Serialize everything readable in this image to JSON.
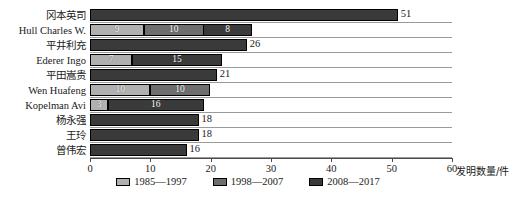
{
  "chart_data": {
    "type": "bar",
    "orientation": "horizontal",
    "stacked": true,
    "title": "",
    "xlabel": "发明数量/件",
    "ylabel": "",
    "xlim": [
      0,
      60
    ],
    "xticks": [
      0,
      10,
      20,
      30,
      40,
      50,
      60
    ],
    "grid": true,
    "legend_position": "bottom",
    "categories": [
      "冈本英司",
      "Hull Charles W.",
      "平井利充",
      "Ederer Ingo",
      "平田嵩贵",
      "Wen Huafeng",
      "Kopelman Avi",
      "杨永强",
      "王玲",
      "曾伟宏"
    ],
    "series": [
      {
        "name": "1985—1997",
        "color": "#b0b0b0",
        "values": [
          0,
          9,
          0,
          7,
          0,
          10,
          3,
          0,
          0,
          0
        ]
      },
      {
        "name": "1998—2007",
        "color": "#6e6e6e",
        "values": [
          0,
          10,
          0,
          0,
          0,
          10,
          0,
          0,
          0,
          0
        ]
      },
      {
        "name": "2008—2017",
        "color": "#3a3a3a",
        "values": [
          51,
          8,
          26,
          15,
          21,
          0,
          16,
          18,
          18,
          16
        ]
      }
    ],
    "totals": [
      51,
      27,
      26,
      22,
      21,
      20,
      19,
      18,
      18,
      16
    ],
    "total_labels": [
      "51",
      "",
      "26",
      "",
      "21",
      "",
      "",
      "18",
      "18",
      "16"
    ],
    "segment_labels": [
      [],
      [
        "9",
        "10",
        "8"
      ],
      [],
      [
        "7",
        "15"
      ],
      [],
      [
        "10",
        "10"
      ],
      [
        "3",
        "16"
      ],
      [],
      [],
      []
    ]
  },
  "legend": {
    "items": [
      {
        "label": "1985—1997"
      },
      {
        "label": "1998—2007"
      },
      {
        "label": "2008—2017"
      }
    ]
  },
  "axis": {
    "tick_labels": [
      "0",
      "10",
      "20",
      "30",
      "40",
      "50",
      "60"
    ],
    "title": "发明数量/件"
  }
}
